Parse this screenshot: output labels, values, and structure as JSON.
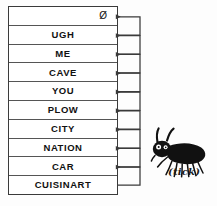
{
  "figure": {
    "type": "linked-list-stack-diagram",
    "background_color": "#fdfdfd",
    "ink_color": "#2b2b2b"
  },
  "stack": {
    "name": "word-stack",
    "cell_count": 10,
    "cells": [
      {
        "label": "Ø",
        "kind": "null-terminator",
        "align": "right"
      },
      {
        "label": "UGH",
        "kind": "word",
        "align": "center"
      },
      {
        "label": "ME",
        "kind": "word",
        "align": "center"
      },
      {
        "label": "CAVE",
        "kind": "word",
        "align": "center"
      },
      {
        "label": "YOU",
        "kind": "word",
        "align": "center"
      },
      {
        "label": "PLOW",
        "kind": "word",
        "align": "center"
      },
      {
        "label": "CITY",
        "kind": "word",
        "align": "center"
      },
      {
        "label": "NATION",
        "kind": "word",
        "align": "center"
      },
      {
        "label": "CAR",
        "kind": "word",
        "align": "center"
      },
      {
        "label": "CUISINART",
        "kind": "word",
        "align": "center"
      }
    ]
  },
  "connectors": {
    "name": "pointer-arrows",
    "count": 9,
    "description": "each cell links rightward then up into an arrowhead pointing back left at the cell above",
    "arrow_direction": "left",
    "stroke_color": "#3a3a3a"
  },
  "illustration": {
    "name": "tick-drawing",
    "caption": "(tick)",
    "subject": "tick",
    "style": "hand-drawn-ink",
    "color": "#111111"
  }
}
